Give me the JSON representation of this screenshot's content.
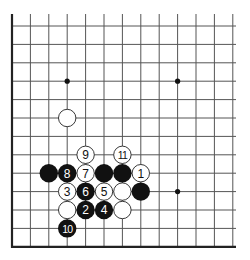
{
  "board": {
    "title": "Go corner diagram",
    "colors": {
      "background": "#ffffff",
      "line": "#555555",
      "edge": "#222222",
      "black": "#111111",
      "white": "#ffffff",
      "stone_outline": "#222222"
    },
    "grid": {
      "x0": 12,
      "y0": 26,
      "spacing": 18.4,
      "cols": 13,
      "rows": 13,
      "line_top": 14,
      "line_right": 236
    },
    "edges": [
      "left",
      "bottom"
    ],
    "star_points": [
      {
        "col": 3,
        "row": 3
      },
      {
        "col": 9,
        "row": 3
      },
      {
        "col": 9,
        "row": 9
      }
    ],
    "stones": [
      {
        "col": 3,
        "row": 5,
        "color": "white",
        "label": ""
      },
      {
        "col": 4,
        "row": 7,
        "color": "white",
        "label": "9"
      },
      {
        "col": 6,
        "row": 7,
        "color": "white",
        "label": "11"
      },
      {
        "col": 2,
        "row": 8,
        "color": "black",
        "label": ""
      },
      {
        "col": 3,
        "row": 8,
        "color": "black",
        "label": "8"
      },
      {
        "col": 4,
        "row": 8,
        "color": "white",
        "label": "7"
      },
      {
        "col": 5,
        "row": 8,
        "color": "black",
        "label": ""
      },
      {
        "col": 6,
        "row": 8,
        "color": "black",
        "label": ""
      },
      {
        "col": 7,
        "row": 8,
        "color": "white",
        "label": "1"
      },
      {
        "col": 3,
        "row": 9,
        "color": "white",
        "label": "3"
      },
      {
        "col": 4,
        "row": 9,
        "color": "black",
        "label": "6"
      },
      {
        "col": 5,
        "row": 9,
        "color": "white",
        "label": "5"
      },
      {
        "col": 6,
        "row": 9,
        "color": "white",
        "label": ""
      },
      {
        "col": 7,
        "row": 9,
        "color": "black",
        "label": ""
      },
      {
        "col": 3,
        "row": 10,
        "color": "white",
        "label": ""
      },
      {
        "col": 4,
        "row": 10,
        "color": "black",
        "label": "2"
      },
      {
        "col": 5,
        "row": 10,
        "color": "black",
        "label": "4"
      },
      {
        "col": 6,
        "row": 10,
        "color": "white",
        "label": ""
      },
      {
        "col": 3,
        "row": 11,
        "color": "black",
        "label": "10"
      }
    ]
  }
}
